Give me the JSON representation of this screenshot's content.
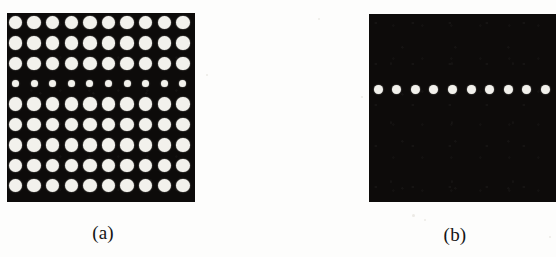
{
  "figure": {
    "background_color": "#fdfdfc",
    "plate_color": "#0d0b0a",
    "dot_color": "#f2f1ec",
    "panels": [
      {
        "id": "panel-a",
        "caption": "(a)",
        "caption_center_x": 103,
        "caption_y": 222,
        "plate": {
          "x": 7,
          "y": 13,
          "width": 188,
          "height": 189
        },
        "grid": {
          "columns": 10,
          "rows": 9,
          "pitch_x": 18.6,
          "pitch_y": 20.4,
          "origin_x": 15.5,
          "origin_y": 22.5,
          "default_dot_diameter": 13.6,
          "small_row_index": 3,
          "small_dot_diameter": 7.0
        },
        "dot_count": 90,
        "description_row_sizes": [
          13.6,
          13.6,
          13.6,
          7.0,
          13.6,
          13.6,
          13.6,
          13.6,
          13.6
        ]
      },
      {
        "id": "panel-b",
        "caption": "(b)",
        "caption_center_x": 455,
        "caption_y": 224,
        "plate": {
          "x": 369,
          "y": 14,
          "width": 187,
          "height": 188
        },
        "grid": {
          "columns": 10,
          "rows": 1,
          "pitch_x": 18.6,
          "origin_x": 378,
          "row_center_y": 89,
          "default_dot_diameter": 9.0
        },
        "dot_count": 10,
        "cropped_at_right_edge": true
      }
    ],
    "speckles": [
      {
        "x": 318,
        "y": 18,
        "size": 2
      },
      {
        "x": 361,
        "y": 96,
        "size": 2
      },
      {
        "x": 412,
        "y": 214,
        "size": 3
      },
      {
        "x": 424,
        "y": 219,
        "size": 2
      },
      {
        "x": 206,
        "y": 74,
        "size": 2
      },
      {
        "x": 549,
        "y": 236,
        "size": 2
      }
    ]
  }
}
